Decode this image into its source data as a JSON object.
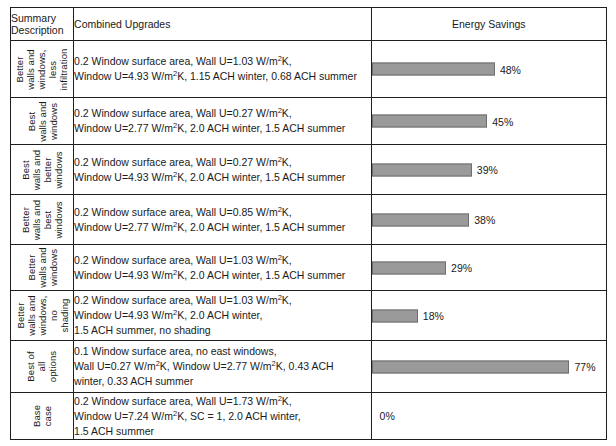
{
  "table": {
    "headers": {
      "summary": "Summary\nDescription",
      "summary_line1": "Summary",
      "summary_line2": "Description",
      "combined": "Combined Upgrades",
      "savings": "Energy Savings"
    },
    "bar_color": "#9a9a9a",
    "bar_border_color": "#6e6e6e",
    "max_percent": 77,
    "bar_scale_px_per_percent": 2.57,
    "rows": [
      {
        "label_lines": [
          "Better",
          "walls and",
          "windows,",
          "less",
          "infiltration"
        ],
        "desc_lines": [
          "0.2 Window surface area, Wall U=1.03 W/m²K,",
          "Window U=4.93 W/m²K, 1.15 ACH winter, 0.68 ACH summer"
        ],
        "savings_percent": 48,
        "savings_label": "48%"
      },
      {
        "label_lines": [
          "Best",
          "walls and",
          "windows"
        ],
        "desc_lines": [
          "0.2 Window surface area, Wall U=0.27 W/m²K,",
          "Window U=2.77 W/m²K, 2.0 ACH winter, 1.5 ACH summer"
        ],
        "savings_percent": 45,
        "savings_label": "45%"
      },
      {
        "label_lines": [
          "Best",
          "walls and",
          "better",
          "windows"
        ],
        "desc_lines": [
          "0.2 Window surface area, Wall U=0.27 W/m²K,",
          "Window U=4.93 W/m²K, 2.0 ACH winter, 1.5 ACH summer"
        ],
        "savings_percent": 39,
        "savings_label": "39%"
      },
      {
        "label_lines": [
          "Better",
          "walls and",
          "best",
          "windows"
        ],
        "desc_lines": [
          "0.2 Window surface area, Wall U=0.85 W/m²K,",
          "Window U=2.77 W/m²K, 2.0 ACH winter, 1.5 ACH summer"
        ],
        "savings_percent": 38,
        "savings_label": "38%"
      },
      {
        "label_lines": [
          "Better",
          "walls and",
          "windows"
        ],
        "desc_lines": [
          "0.2 Window surface area, Wall U=1.03 W/m²K,",
          "Window U=4.93 W/m²K, 2.0 ACH winter, 1.5 ACH summer"
        ],
        "savings_percent": 29,
        "savings_label": "29%"
      },
      {
        "label_lines": [
          "Better",
          "walls and",
          "windows,",
          "no",
          "shading"
        ],
        "desc_lines": [
          "0.2 Window surface area, Wall U=1.03 W/m²K,",
          "Window U=4.93 W/m²K, 2.0 ACH winter,",
          "1.5 ACH summer, no shading"
        ],
        "savings_percent": 18,
        "savings_label": "18%"
      },
      {
        "label_lines": [
          "Best of",
          "all",
          "options"
        ],
        "desc_lines": [
          "0.1 Window surface area, no east windows,",
          "Wall U=0.27 W/m²K, Window U=2.77 W/m²K, 0.43 ACH",
          "winter, 0.33 ACH summer"
        ],
        "savings_percent": 77,
        "savings_label": "77%"
      },
      {
        "label_lines": [
          "Base",
          "case"
        ],
        "desc_lines": [
          "0.2 Window surface area, Wall U=1.73 W/m²K,",
          "Window U=7.24 W/m²K, SC = 1, 2.0 ACH winter,",
          "1.5 ACH summer"
        ],
        "savings_percent": 0,
        "savings_label": "0%"
      }
    ]
  },
  "chart_data": {
    "type": "bar",
    "orientation": "horizontal",
    "title": "Energy Savings",
    "xlabel": "Energy Savings (%)",
    "ylabel": "Summary Description",
    "xlim": [
      0,
      77
    ],
    "grid": false,
    "legend": null,
    "categories": [
      "Better walls and windows, less infiltration",
      "Best walls and windows",
      "Best walls and better windows",
      "Better walls and best windows",
      "Better walls and windows",
      "Better walls and windows, no shading",
      "Best of all options",
      "Base case"
    ],
    "values": [
      48,
      45,
      39,
      38,
      29,
      18,
      77,
      0
    ],
    "data_labels": [
      "48%",
      "45%",
      "39%",
      "38%",
      "29%",
      "18%",
      "77%",
      "0%"
    ]
  }
}
